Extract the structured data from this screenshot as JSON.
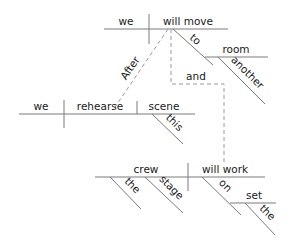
{
  "diagram": {
    "type": "sentence-diagram",
    "clause_main": {
      "subject": "we",
      "verb": "will move",
      "prepositional_phrase": {
        "preposition": "to",
        "object": "room",
        "modifier": "another"
      }
    },
    "subordinate_conjunction": "After",
    "clause_sub": {
      "subject": "we",
      "verb": "rehearse",
      "direct_object": "scene",
      "modifier": "this"
    },
    "coordinating_conjunction": "and",
    "clause_coord": {
      "subject": "crew",
      "subject_modifiers": [
        "the",
        "stage"
      ],
      "verb": "will work",
      "prepositional_phrase": {
        "preposition": "on",
        "object": "set",
        "modifier": "the"
      }
    }
  }
}
